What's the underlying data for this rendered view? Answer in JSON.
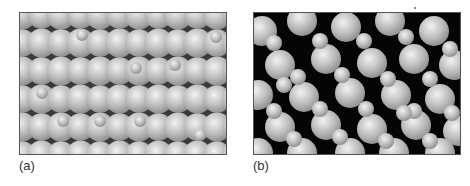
{
  "figure": {
    "panels": [
      {
        "id": "a",
        "label": "(a)",
        "description": "Close-packed array of large gray spheres with small spheres occupying some interstitial sites"
      },
      {
        "id": "b",
        "label": "(b)",
        "description": "Disordered arrangement of large and small gray spheres with dark voids between them"
      }
    ],
    "colors": {
      "sphere_highlight": "#f2f2f2",
      "sphere_mid": "#bdbdbd",
      "sphere_shadow": "#8a8a8a",
      "void_a": "#3a3a3a",
      "void_b": "#050505"
    }
  }
}
